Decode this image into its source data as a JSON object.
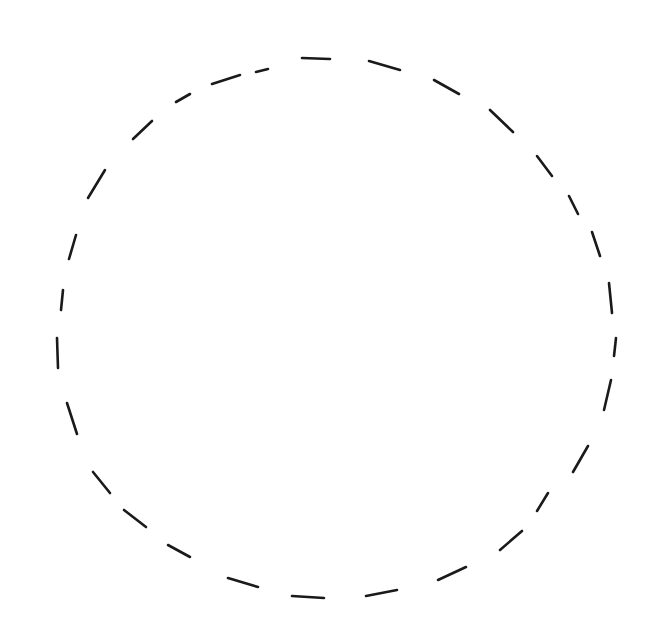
{
  "figure": {
    "stroke_color": "#1a1a1a",
    "background": "#ffffff",
    "shape": "circle",
    "line_style": "dashed"
  }
}
